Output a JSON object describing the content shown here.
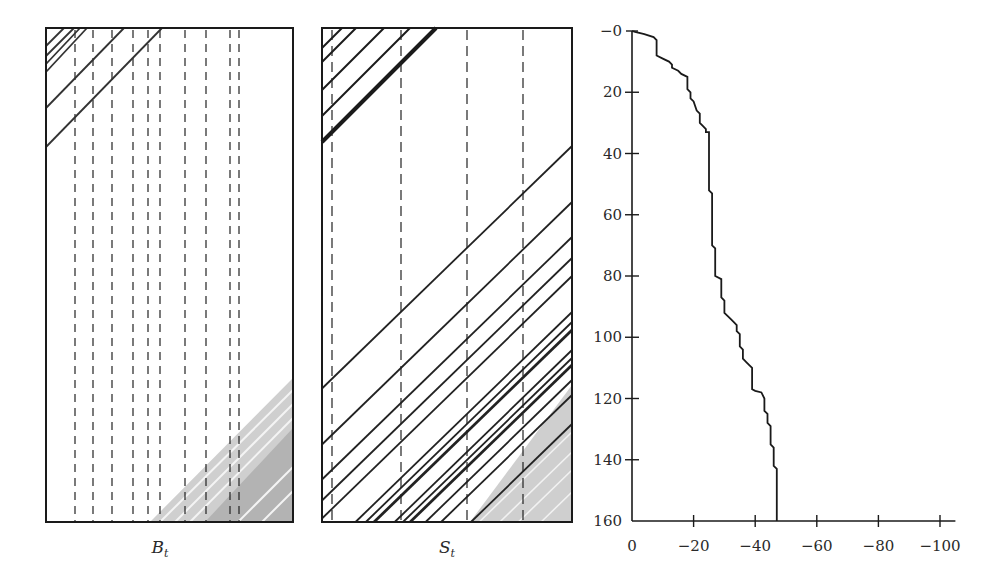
{
  "chart_data": [
    {
      "type": "heatmap",
      "title": "",
      "panel_label": "B",
      "panel_label_sub": "t",
      "xlabel": "B_t",
      "description": "Space-time diagram: diagonal trajectories (45 deg) in upper-left corner, vertical dashed lines, gray-shaded triangular region in lower-right with white streaks.",
      "dashed_lines_x_px": [
        75,
        93,
        112,
        133,
        148,
        160,
        185,
        206,
        230,
        239
      ],
      "dark_diagonals": [
        {
          "from": [
            46,
            46
          ],
          "to": [
            64,
            28
          ]
        },
        {
          "from": [
            46,
            56
          ],
          "to": [
            74,
            28
          ]
        },
        {
          "from": [
            46,
            64
          ],
          "to": [
            80,
            28
          ]
        },
        {
          "from": [
            46,
            72
          ],
          "to": [
            87,
            28
          ]
        },
        {
          "from": [
            46,
            108
          ],
          "to": [
            124,
            28
          ]
        },
        {
          "from": [
            46,
            147
          ],
          "to": [
            162,
            28
          ]
        }
      ],
      "gray_light_region": [
        [
          150,
          522
        ],
        [
          293,
          378
        ],
        [
          293,
          522
        ]
      ],
      "gray_dark_region": [
        [
          205,
          522
        ],
        [
          293,
          428
        ],
        [
          293,
          522
        ]
      ],
      "light_streaks": [
        {
          "from": [
            160,
            522
          ],
          "to": [
            293,
            390
          ]
        },
        {
          "from": [
            175,
            522
          ],
          "to": [
            293,
            404
          ]
        },
        {
          "from": [
            190,
            522
          ],
          "to": [
            293,
            418
          ]
        },
        {
          "from": [
            238,
            522
          ],
          "to": [
            293,
            467
          ]
        },
        {
          "from": [
            262,
            522
          ],
          "to": [
            293,
            491
          ]
        }
      ],
      "frame_px": {
        "x": 46,
        "y": 28,
        "w": 247,
        "h": 494
      },
      "grid": false
    },
    {
      "type": "heatmap",
      "title": "",
      "panel_label": "S",
      "panel_label_sub": "t",
      "xlabel": "S_t",
      "description": "Space-time diagram: many parallel 45-degree trajectories across the panel; thick dark band in upper-left, dense band lower-right over gray shaded triangle.",
      "dashed_lines_x_px": [
        332,
        401,
        467,
        523
      ],
      "frame_px": {
        "x": 322,
        "y": 28,
        "w": 250,
        "h": 494
      },
      "diagonals_right_edge_y_px": [
        146,
        202,
        237,
        258,
        276,
        312,
        322,
        330,
        350,
        358,
        365,
        380,
        395,
        424
      ],
      "upper_left_diagonals": [
        {
          "from": [
            322,
            48
          ],
          "to": [
            342,
            28
          ],
          "w": 2
        },
        {
          "from": [
            322,
            62
          ],
          "to": [
            356,
            28
          ],
          "w": 2
        },
        {
          "from": [
            322,
            90
          ],
          "to": [
            384,
            28
          ],
          "w": 2
        },
        {
          "from": [
            322,
            116
          ],
          "to": [
            410,
            28
          ],
          "w": 2
        },
        {
          "from": [
            322,
            142
          ],
          "to": [
            436,
            28
          ],
          "w": 4
        }
      ],
      "gray_region": [
        [
          470,
          522
        ],
        [
          572,
          385
        ],
        [
          572,
          522
        ]
      ],
      "grid": false
    },
    {
      "type": "line",
      "step": true,
      "title": "",
      "xlabel": "",
      "ylabel": "",
      "xlim": [
        0,
        -100
      ],
      "ylim": [
        0,
        160
      ],
      "y_inverted": true,
      "x_ticks": [
        "0",
        "−20",
        "−40",
        "−60",
        "−80",
        "−100"
      ],
      "x_tick_values": [
        0,
        -20,
        -40,
        -60,
        -80,
        -100
      ],
      "y_ticks": [
        "−0",
        "20",
        "40",
        "60",
        "80",
        "100",
        "120",
        "140",
        "160"
      ],
      "y_tick_values": [
        0,
        20,
        40,
        60,
        80,
        100,
        120,
        140,
        160
      ],
      "series": [
        {
          "name": "cumulative",
          "points": [
            [
              0,
              0
            ],
            [
              -1,
              0.3
            ],
            [
              -4,
              1
            ],
            [
              -7,
              2
            ],
            [
              -8,
              3
            ],
            [
              -8,
              8
            ],
            [
              -10,
              9
            ],
            [
              -12,
              10
            ],
            [
              -13,
              11
            ],
            [
              -13,
              12
            ],
            [
              -15,
              13
            ],
            [
              -16,
              14
            ],
            [
              -18,
              15
            ],
            [
              -18,
              19
            ],
            [
              -19,
              20
            ],
            [
              -19,
              22
            ],
            [
              -20,
              23
            ],
            [
              -21,
              26
            ],
            [
              -22,
              27
            ],
            [
              -22,
              30
            ],
            [
              -23,
              31
            ],
            [
              -24,
              32
            ],
            [
              -24,
              33
            ],
            [
              -25,
              33
            ],
            [
              -25,
              52
            ],
            [
              -26,
              53
            ],
            [
              -26,
              70
            ],
            [
              -27,
              71
            ],
            [
              -27,
              80
            ],
            [
              -29,
              81
            ],
            [
              -29,
              87
            ],
            [
              -30,
              88
            ],
            [
              -30,
              92
            ],
            [
              -31,
              93
            ],
            [
              -32,
              94
            ],
            [
              -33,
              95
            ],
            [
              -34,
              96
            ],
            [
              -34,
              98
            ],
            [
              -35,
              99
            ],
            [
              -35,
              103
            ],
            [
              -36,
              104
            ],
            [
              -36,
              107
            ],
            [
              -37,
              108
            ],
            [
              -38,
              109
            ],
            [
              -39,
              110
            ],
            [
              -39,
              117
            ],
            [
              -40,
              117.5
            ],
            [
              -42,
              118
            ],
            [
              -43,
              120
            ],
            [
              -43,
              124
            ],
            [
              -44,
              125
            ],
            [
              -44,
              128
            ],
            [
              -45,
              129
            ],
            [
              -45,
              135
            ],
            [
              -46,
              136
            ],
            [
              -46,
              142
            ],
            [
              -47,
              143
            ],
            [
              -47,
              160
            ]
          ]
        }
      ],
      "grid": false,
      "legend": null
    }
  ],
  "labels": {
    "left_panel": "B",
    "left_panel_sub": "t",
    "middle_panel": "S",
    "middle_panel_sub": "t"
  },
  "colors": {
    "line": "#1a1a1a",
    "dashed": "#222222",
    "gray_light": "#cfcfcf",
    "gray_dark": "#b3b3b3",
    "frame": "#1a1a1a"
  }
}
